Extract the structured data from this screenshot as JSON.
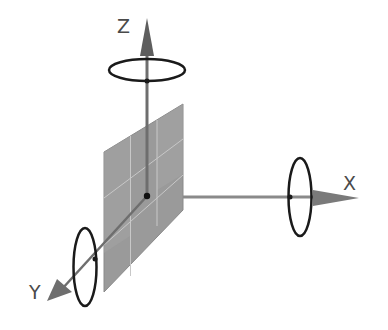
{
  "diagram": {
    "axes": [
      {
        "id": "z",
        "label": "Z",
        "direction": "up"
      },
      {
        "id": "x",
        "label": "X",
        "direction": "right"
      },
      {
        "id": "y",
        "label": "Y",
        "direction": "down-left"
      }
    ],
    "rotation_rings": [
      "z-ring",
      "x-ring",
      "y-ring"
    ],
    "panel": {
      "rows": 3,
      "cols": 3
    },
    "colors": {
      "axis": "#6e6e6e",
      "ring": "#1a1a1a",
      "panel": "#9a9a9a",
      "panel_grid": "#c8c8c8",
      "label": "#4a4a4a",
      "origin_dot": "#111111"
    }
  }
}
